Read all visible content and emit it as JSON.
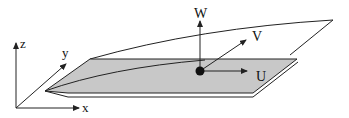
{
  "diagram": {
    "type": "3d-coordinate-schematic",
    "axes": {
      "x_label": "x",
      "y_label": "y",
      "z_label": "z"
    },
    "vectors": {
      "w_label": "W",
      "v_label": "V",
      "u_label": "U"
    },
    "colors": {
      "plate_fill": "#c8c8c8",
      "stroke": "#222222",
      "point": "#111111"
    }
  }
}
